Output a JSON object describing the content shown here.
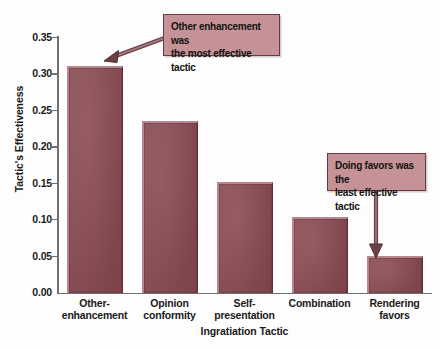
{
  "chart_data": {
    "type": "bar",
    "title": "",
    "xlabel": "Ingratiation Tactic",
    "ylabel": "Tactic's Effectiveness",
    "categories": [
      "Other-\nenhancement",
      "Opinion\nconformity",
      "Self-\npresentation",
      "Combination",
      "Rendering\nfavors"
    ],
    "category_lines": [
      [
        "Other-",
        "enhancement"
      ],
      [
        "Opinion",
        "conformity"
      ],
      [
        "Self-",
        "presentation"
      ],
      [
        "Combination",
        ""
      ],
      [
        "Rendering",
        "favors"
      ]
    ],
    "values": [
      0.31,
      0.235,
      0.152,
      0.103,
      0.05
    ],
    "ylim": [
      0.0,
      0.35
    ],
    "ytick_labels": [
      "0.35",
      "0.30",
      "0.25",
      "0.20",
      "0.15",
      "0.10",
      "0.05",
      "0.00"
    ],
    "ytick_values": [
      0.35,
      0.3,
      0.25,
      0.2,
      0.15,
      0.1,
      0.05,
      0.0
    ],
    "grid": false,
    "legend": null,
    "bar_color": "#8c4b53",
    "annotations": [
      {
        "id": "callout-most-effective",
        "lines": [
          "Other enhancement was",
          "the most effective tactic"
        ],
        "target_category": "Other-enhancement",
        "arrow": "diagonal-down-left"
      },
      {
        "id": "callout-least-effective",
        "lines": [
          "Doing favors was the",
          "least effective tactic"
        ],
        "target_category": "Rendering favors",
        "arrow": "vertical-down"
      }
    ]
  },
  "colors": {
    "background": "#fdfdfd",
    "bar_fill": "#8c4b53",
    "bar_highlight": "#b8868c",
    "bar_shadow": "#5e2f35",
    "callout_fill": "#c59298",
    "callout_border": "#6d3940",
    "axis": "#6f6f6f",
    "text": "#1a1a1a"
  }
}
